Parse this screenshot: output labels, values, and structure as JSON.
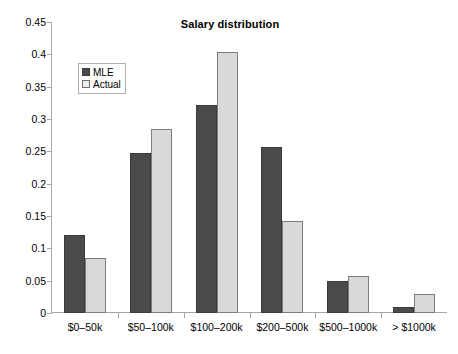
{
  "chart_data": {
    "type": "bar",
    "title": "Salary distribution",
    "xlabel": "",
    "ylabel": "",
    "ylim": [
      0,
      0.45
    ],
    "ytick_labels": [
      "0",
      "0.05",
      "0.1",
      "0.15",
      "0.2",
      "0.25",
      "0.3",
      "0.35",
      "0.4",
      "0.45"
    ],
    "ytick_values": [
      0,
      0.05,
      0.1,
      0.15,
      0.2,
      0.25,
      0.3,
      0.35,
      0.4,
      0.45
    ],
    "grid": false,
    "legend_position": "upper-left-inside",
    "categories": [
      "$0–50k",
      "$50–100k",
      "$100–200k",
      "$200–500k",
      "$500–1000k",
      "> $1000k"
    ],
    "series": [
      {
        "name": "MLE",
        "color": "#4a4a4a",
        "values": [
          0.12,
          0.247,
          0.322,
          0.257,
          0.05,
          0.009
        ]
      },
      {
        "name": "Actual",
        "color": "#d9d9d9",
        "values": [
          0.085,
          0.284,
          0.403,
          0.142,
          0.057,
          0.029
        ]
      }
    ]
  },
  "legend": {
    "items": [
      {
        "label": "MLE",
        "swatch": "mle"
      },
      {
        "label": "Actual",
        "swatch": "actual"
      }
    ]
  }
}
